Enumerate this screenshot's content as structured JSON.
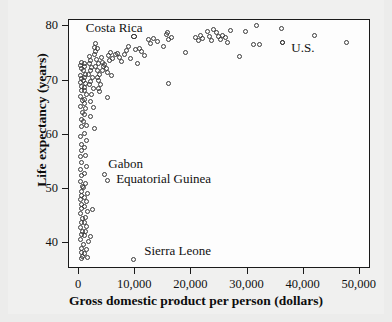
{
  "chart_data": {
    "type": "scatter",
    "title": "",
    "xlabel": "Gross domestic product per person (dollars)",
    "ylabel": "Life expectancy (years)",
    "xlim": [
      -1800,
      52000
    ],
    "ylim": [
      35.2,
      81.2
    ],
    "grid": false,
    "legend": null,
    "xticks": [
      0,
      10000,
      20000,
      30000,
      40000,
      50000
    ],
    "xtick_labels": [
      "0",
      "10,000",
      "20,000",
      "30,000",
      "40,000",
      "50,000"
    ],
    "yticks": [
      40,
      50,
      60,
      70,
      80
    ],
    "ytick_labels": [
      "40",
      "50",
      "60",
      "70",
      "80"
    ],
    "marker": "open-circle",
    "annotations": [
      {
        "text": "Costa Rica",
        "x": 1200,
        "y": 79.8,
        "anchor": "left"
      },
      {
        "text": "Gabon",
        "x": 5200,
        "y": 54.6,
        "anchor": "left"
      },
      {
        "text": "Equatorial Guinea",
        "x": 6600,
        "y": 51.8,
        "anchor": "left"
      },
      {
        "text": "Sierra Leone",
        "x": 11600,
        "y": 38.6,
        "anchor": "left"
      },
      {
        "text": "U.S.",
        "x": 37800,
        "y": 76.0,
        "anchor": "left"
      }
    ],
    "highlighted_points": [
      {
        "label": "Costa Rica",
        "x": 9800,
        "y": 78.1
      },
      {
        "label": "U.S.",
        "x": 36200,
        "y": 77.0
      }
    ],
    "points": [
      [
        9800,
        78.1
      ],
      [
        36200,
        77.0
      ],
      [
        4500,
        52.7
      ],
      [
        5000,
        51.5
      ],
      [
        9700,
        36.9
      ],
      [
        300,
        72.8
      ],
      [
        350,
        73.4
      ],
      [
        420,
        72.2
      ],
      [
        300,
        71.0
      ],
      [
        450,
        70.4
      ],
      [
        250,
        69.6
      ],
      [
        500,
        69.0
      ],
      [
        380,
        68.2
      ],
      [
        300,
        67.1
      ],
      [
        520,
        66.3
      ],
      [
        280,
        65.2
      ],
      [
        600,
        64.1
      ],
      [
        340,
        62.9
      ],
      [
        420,
        61.6
      ],
      [
        300,
        59.7
      ],
      [
        480,
        58.2
      ],
      [
        350,
        57.0
      ],
      [
        300,
        55.9
      ],
      [
        420,
        54.8
      ],
      [
        260,
        53.6
      ],
      [
        380,
        52.4
      ],
      [
        300,
        51.3
      ],
      [
        520,
        50.4
      ],
      [
        340,
        49.6
      ],
      [
        420,
        48.8
      ],
      [
        300,
        48.0
      ],
      [
        480,
        47.2
      ],
      [
        360,
        46.3
      ],
      [
        300,
        45.4
      ],
      [
        560,
        44.6
      ],
      [
        400,
        43.7
      ],
      [
        320,
        42.9
      ],
      [
        600,
        42.2
      ],
      [
        420,
        41.5
      ],
      [
        300,
        40.6
      ],
      [
        700,
        39.8
      ],
      [
        500,
        38.9
      ],
      [
        380,
        38.2
      ],
      [
        620,
        37.6
      ],
      [
        460,
        37.1
      ],
      [
        900,
        73.2
      ],
      [
        1000,
        72.6
      ],
      [
        850,
        71.9
      ],
      [
        1100,
        71.2
      ],
      [
        950,
        70.6
      ],
      [
        800,
        70.0
      ],
      [
        1200,
        69.4
      ],
      [
        1000,
        68.8
      ],
      [
        900,
        68.1
      ],
      [
        1300,
        67.4
      ],
      [
        1050,
        66.6
      ],
      [
        880,
        65.8
      ],
      [
        1150,
        64.9
      ],
      [
        980,
        63.8
      ],
      [
        820,
        62.4
      ],
      [
        1250,
        61.8
      ],
      [
        1000,
        60.2
      ],
      [
        1400,
        59.0
      ],
      [
        900,
        57.6
      ],
      [
        1100,
        56.2
      ],
      [
        1300,
        54.2
      ],
      [
        1000,
        52.8
      ],
      [
        1200,
        51.0
      ],
      [
        850,
        50.2
      ],
      [
        1450,
        49.2
      ],
      [
        1000,
        48.4
      ],
      [
        1250,
        47.6
      ],
      [
        900,
        46.8
      ],
      [
        1500,
        45.8
      ],
      [
        1100,
        44.8
      ],
      [
        950,
        43.8
      ],
      [
        1350,
        43.0
      ],
      [
        1200,
        42.2
      ],
      [
        1000,
        41.4
      ],
      [
        1600,
        40.2
      ],
      [
        1250,
        38.8
      ],
      [
        1050,
        38.0
      ],
      [
        1500,
        37.4
      ],
      [
        1800,
        74.5
      ],
      [
        2000,
        73.8
      ],
      [
        1900,
        73.1
      ],
      [
        2200,
        72.4
      ],
      [
        2050,
        71.8
      ],
      [
        1750,
        71.1
      ],
      [
        2400,
        70.5
      ],
      [
        2100,
        69.8
      ],
      [
        1850,
        69.2
      ],
      [
        2600,
        68.5
      ],
      [
        2200,
        67.4
      ],
      [
        1950,
        66.2
      ],
      [
        2500,
        65.0
      ],
      [
        2000,
        63.4
      ],
      [
        2800,
        61.2
      ],
      [
        2300,
        46.2
      ],
      [
        2100,
        41.2
      ],
      [
        2700,
        76.2
      ],
      [
        3000,
        75.4
      ],
      [
        2800,
        74.8
      ],
      [
        3200,
        75.9
      ],
      [
        2900,
        76.8
      ],
      [
        3100,
        73.9
      ],
      [
        3400,
        73.2
      ],
      [
        3000,
        72.6
      ],
      [
        3300,
        71.9
      ],
      [
        3600,
        71.2
      ],
      [
        3200,
        70.6
      ],
      [
        3500,
        70.0
      ],
      [
        3800,
        69.3
      ],
      [
        3400,
        68.6
      ],
      [
        3700,
        67.9
      ],
      [
        4000,
        74.2
      ],
      [
        4200,
        73.4
      ],
      [
        4400,
        72.6
      ],
      [
        4100,
        71.8
      ],
      [
        4600,
        73.0
      ],
      [
        4800,
        72.2
      ],
      [
        5000,
        71.5
      ],
      [
        5200,
        74.6
      ],
      [
        5400,
        73.8
      ],
      [
        5600,
        75.2
      ],
      [
        5800,
        71.0
      ],
      [
        6000,
        74.0
      ],
      [
        5100,
        66.8
      ],
      [
        6400,
        74.8
      ],
      [
        6800,
        75.1
      ],
      [
        7200,
        74.3
      ],
      [
        7600,
        73.6
      ],
      [
        8000,
        74.9
      ],
      [
        8400,
        75.5
      ],
      [
        8800,
        76.3
      ],
      [
        9200,
        74.1
      ],
      [
        10000,
        75.8
      ],
      [
        10400,
        73.2
      ],
      [
        10800,
        76.0
      ],
      [
        11200,
        75.4
      ],
      [
        11600,
        74.6
      ],
      [
        12400,
        77.6
      ],
      [
        12800,
        76.9
      ],
      [
        13200,
        77.8
      ],
      [
        14000,
        77.2
      ],
      [
        15000,
        76.3
      ],
      [
        15600,
        78.6
      ],
      [
        15800,
        78.9
      ],
      [
        16000,
        77.6
      ],
      [
        16400,
        77.9
      ],
      [
        15900,
        69.4
      ],
      [
        19000,
        75.2
      ],
      [
        20800,
        78.0
      ],
      [
        21200,
        77.5
      ],
      [
        21600,
        78.3
      ],
      [
        22000,
        77.7
      ],
      [
        22800,
        79.1
      ],
      [
        23200,
        78.2
      ],
      [
        23600,
        77.4
      ],
      [
        24000,
        79.4
      ],
      [
        24400,
        78.8
      ],
      [
        24800,
        78.1
      ],
      [
        25200,
        77.6
      ],
      [
        25600,
        78.4
      ],
      [
        26000,
        78.0
      ],
      [
        26400,
        77.0
      ],
      [
        27000,
        79.2
      ],
      [
        28600,
        74.4
      ],
      [
        29600,
        79.1
      ],
      [
        31000,
        76.6
      ],
      [
        31600,
        80.2
      ],
      [
        32200,
        76.6
      ],
      [
        36000,
        79.6
      ],
      [
        42000,
        78.4
      ],
      [
        47600,
        77.1
      ]
    ]
  },
  "axes": {
    "x_title": "Gross domestic product per person (dollars)",
    "y_title": "Life expectancy (years)"
  }
}
